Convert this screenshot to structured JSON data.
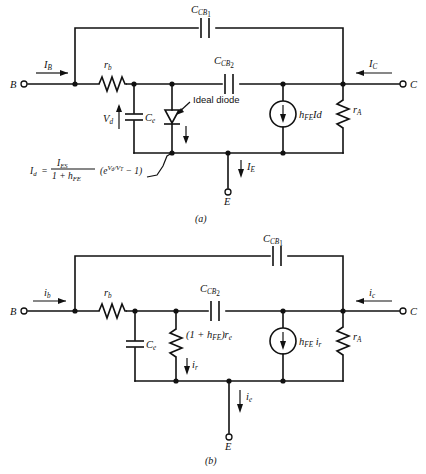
{
  "figure": {
    "panels": [
      {
        "id": "a",
        "caption": "(a)",
        "terminals": {
          "base": "B",
          "collector": "C",
          "emitter": "E"
        },
        "currents": {
          "base": "I",
          "base_sub": "B",
          "collector": "I",
          "collector_sub": "C",
          "emitter": "I",
          "emitter_sub": "E"
        },
        "components": {
          "rb": "r",
          "rb_sub": "b",
          "ccb1": "C",
          "ccb1_sub": "CB",
          "ccb1_sub2": "1",
          "ccb2": "C",
          "ccb2_sub": "CB",
          "ccb2_sub2": "2",
          "ce": "C",
          "ce_sub": "e",
          "vd": "V",
          "vd_sub": "d",
          "diode_label": "Ideal  diode",
          "source": "h",
          "source_sub": "FE",
          "source_tail": "Id",
          "ra": "r",
          "ra_sub": "A"
        },
        "equation": {
          "lhs": "I",
          "lhs_sub": "d",
          "equals": "=",
          "num": "I",
          "num_sub": "ES",
          "den_pre": "1 + h",
          "den_sub": "FE",
          "paren_open": "(e",
          "exp_v": "V",
          "exp_v_sub": "d",
          "exp_slash": "/",
          "exp_vt": "V",
          "exp_vt_sub": "T",
          "tail": "− 1)"
        }
      },
      {
        "id": "b",
        "caption": "(b)",
        "terminals": {
          "base": "B",
          "collector": "C",
          "emitter": "E"
        },
        "currents": {
          "base": "i",
          "base_sub": "b",
          "collector": "i",
          "collector_sub": "c",
          "emitter": "i",
          "emitter_sub": "e",
          "resistor": "i",
          "resistor_sub": "r"
        },
        "components": {
          "rb": "r",
          "rb_sub": "b",
          "ccb1": "C",
          "ccb1_sub": "CB",
          "ccb1_sub2": "1",
          "ccb2": "C",
          "ccb2_sub": "CB",
          "ccb2_sub2": "2",
          "ce": "C",
          "ce_sub": "e",
          "re_pre": "(1 + h",
          "re_sub": "FE",
          "re_mid": ")r",
          "re_sub2": "e",
          "source": "h",
          "source_sub": "FE",
          "source_tail": "i",
          "source_tail_sub": "r",
          "ra": "r",
          "ra_sub": "A"
        }
      }
    ],
    "colors": {
      "ink": "#111111",
      "paper": "#ffffff"
    }
  }
}
